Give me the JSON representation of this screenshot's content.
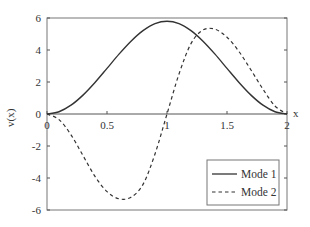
{
  "chart_data": {
    "type": "line",
    "title": "",
    "xlabel": "x",
    "ylabel": "v(x)",
    "xlim": [
      0,
      2
    ],
    "ylim": [
      -6,
      6
    ],
    "xticks": [
      0,
      0.5,
      1,
      1.5,
      2
    ],
    "xtick_labels": [
      "0",
      "0.5",
      "1",
      "1.5",
      "2"
    ],
    "yticks": [
      -6,
      -4,
      -2,
      0,
      2,
      4,
      6
    ],
    "ytick_labels": [
      "-6",
      "-4",
      "-2",
      "0",
      "2",
      "4",
      "6"
    ],
    "grid": false,
    "legend_position": "lower right",
    "series": [
      {
        "name": "Mode 1",
        "style": "solid",
        "x": [
          0,
          0.1,
          0.2,
          0.3,
          0.4,
          0.5,
          0.6,
          0.7,
          0.8,
          0.9,
          1.0,
          1.1,
          1.2,
          1.3,
          1.4,
          1.5,
          1.6,
          1.7,
          1.8,
          1.9,
          2.0
        ],
        "values": [
          0,
          0.14,
          0.55,
          1.18,
          1.97,
          2.85,
          3.74,
          4.55,
          5.21,
          5.65,
          5.8,
          5.65,
          5.21,
          4.55,
          3.74,
          2.85,
          1.97,
          1.18,
          0.55,
          0.14,
          0
        ]
      },
      {
        "name": "Mode 2",
        "style": "dashed",
        "x": [
          0,
          0.1,
          0.2,
          0.3,
          0.4,
          0.5,
          0.6,
          0.7,
          0.8,
          0.9,
          1.0,
          1.1,
          1.2,
          1.3,
          1.4,
          1.5,
          1.6,
          1.7,
          1.8,
          1.9,
          2.0
        ],
        "values": [
          0,
          -0.35,
          -1.3,
          -2.6,
          -3.9,
          -4.85,
          -5.3,
          -5.2,
          -4.4,
          -2.5,
          0,
          2.5,
          4.4,
          5.25,
          5.3,
          4.8,
          3.9,
          2.75,
          1.55,
          0.5,
          0
        ]
      }
    ]
  },
  "legend": {
    "items": [
      {
        "label": "Mode 1"
      },
      {
        "label": "Mode 2"
      }
    ]
  },
  "axes": {
    "xlabel": "x",
    "ylabel": "v(x)"
  }
}
